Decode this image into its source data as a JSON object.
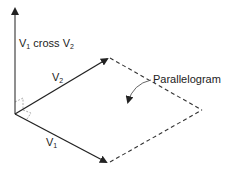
{
  "diagram": {
    "labels": {
      "cross": {
        "base": "V",
        "sub1": "1",
        "mid": " cross V",
        "sub2": "2"
      },
      "v2": {
        "base": "V",
        "sub": "2"
      },
      "v1": {
        "base": "V",
        "sub": "1"
      },
      "parallelogram": "Parallelogram"
    },
    "points": {
      "origin": [
        15,
        114
      ],
      "cross_tip": [
        15,
        8
      ],
      "v2_tip": [
        108,
        58
      ],
      "v1_tip": [
        107,
        163
      ],
      "far_corner": [
        202,
        110
      ]
    },
    "colors": {
      "line": "#222222",
      "dashed": "#333333",
      "right_angle": "#888888"
    }
  }
}
